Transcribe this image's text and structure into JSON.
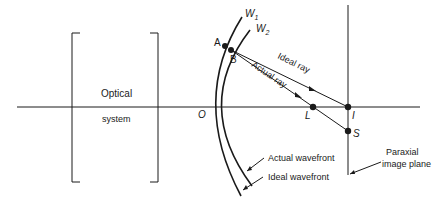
{
  "diagram": {
    "optical_system": {
      "line1": "Optical",
      "line2": "system"
    },
    "points": {
      "O": "O",
      "A": "A",
      "B": "B",
      "L": "L",
      "I": "I",
      "S": "S"
    },
    "wavefronts": {
      "W1_base": "W",
      "W1_sub": "1",
      "W2_base": "W",
      "W2_sub": "2"
    },
    "ray_labels": {
      "ideal": "Ideal ray",
      "actual": "Actual ray"
    },
    "callouts": {
      "actual_wavefront": "Actual wavefront",
      "ideal_wavefront": "Ideal wavefront",
      "paraxial_line1": "Paraxial",
      "paraxial_line2": "image plane"
    },
    "colors": {
      "ink": "#1a1a1a",
      "background": "#ffffff"
    }
  }
}
